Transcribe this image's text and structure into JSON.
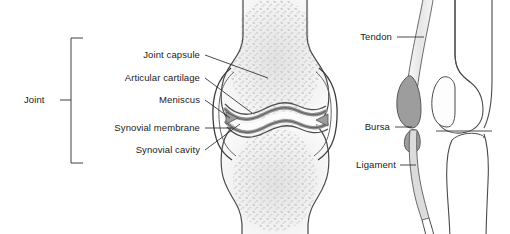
{
  "figure": {
    "background_color": "#ffffff",
    "line_color": "#3a3a3a",
    "text_color": "#1b1b1b"
  },
  "bracket": {
    "label": "Joint"
  },
  "anterior_view": {
    "name": "anterior-knee-cross-section",
    "labels": [
      {
        "id": "joint-capsule",
        "text": "Joint capsule"
      },
      {
        "id": "articular-cartilage",
        "text": "Articular cartilage"
      },
      {
        "id": "meniscus",
        "text": "Meniscus"
      },
      {
        "id": "synovial-membrane",
        "text": "Synovial membrane"
      },
      {
        "id": "synovial-cavity",
        "text": "Synovial cavity"
      }
    ],
    "structures": [
      {
        "id": "femur",
        "name": "femur-bone",
        "fill": "#e8e8e8"
      },
      {
        "id": "tibia",
        "name": "tibia-bone",
        "fill": "#e8e8e8"
      },
      {
        "id": "trabecular-bone",
        "name": "trabecular-stippling",
        "fill": "#cfcfcf"
      },
      {
        "id": "capsule",
        "name": "joint-capsule-outline",
        "fill": "none"
      },
      {
        "id": "cartilage",
        "name": "articular-cartilage-band",
        "fill": "#b4b4b4"
      },
      {
        "id": "cavity",
        "name": "synovial-cavity-space",
        "fill": "#fbfbfb"
      }
    ]
  },
  "lateral_view": {
    "name": "lateral-knee-view",
    "labels": [
      {
        "id": "tendon",
        "text": "Tendon"
      },
      {
        "id": "bursa",
        "text": "Bursa"
      },
      {
        "id": "ligament",
        "text": "Ligament"
      }
    ],
    "structures": [
      {
        "id": "femur-lateral",
        "name": "femur-lateral-bone",
        "fill": "#ffffff"
      },
      {
        "id": "tibia-lateral",
        "name": "tibia-lateral-bone",
        "fill": "#ffffff"
      },
      {
        "id": "patella",
        "name": "patella-bone",
        "fill": "#ffffff"
      },
      {
        "id": "tendon-band",
        "name": "tendon-band",
        "fill": "#ededed"
      },
      {
        "id": "bursa-sac",
        "name": "bursa-sac",
        "fill": "#9d9d9d"
      },
      {
        "id": "ligament-band",
        "name": "ligament-band",
        "fill": "#d8d8d8"
      }
    ]
  }
}
